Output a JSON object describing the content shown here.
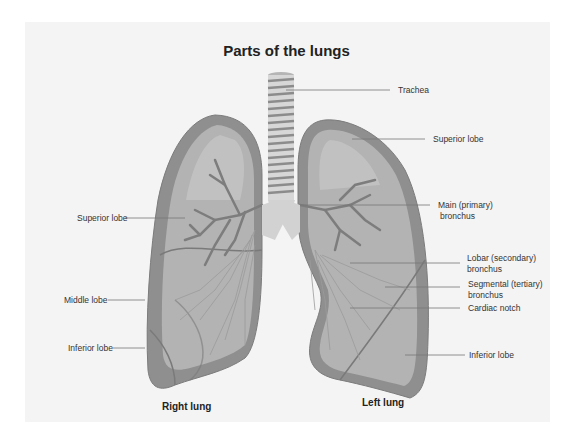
{
  "title": "Parts of the lungs",
  "labels": {
    "trachea": "Trachea",
    "left_superior_lobe": "Superior lobe",
    "main_bronchus_1": "Main (primary)",
    "main_bronchus_2": "bronchus",
    "lobar_bronchus_1": "Lobar (secondary)",
    "lobar_bronchus_2": "bronchus",
    "segmental_bronchus_1": "Segmental (tertiary)",
    "segmental_bronchus_2": "bronchus",
    "cardiac_notch": "Cardiac notch",
    "left_inferior_lobe": "Inferior lobe",
    "right_superior_lobe": "Superior lobe",
    "right_middle_lobe": "Middle lobe",
    "right_inferior_lobe": "Inferior lobe"
  },
  "lungs": {
    "right": "Right lung",
    "left": "Left lung"
  },
  "colors": {
    "background": "#f4f4f4",
    "lung_outer": "#8c8c8c",
    "lung_inner": "#b4b4b4",
    "lung_light": "#c8c8c8",
    "airway": "#d4d4d4",
    "bronchi": "#7a7a7a",
    "leader_line": "#777777"
  }
}
